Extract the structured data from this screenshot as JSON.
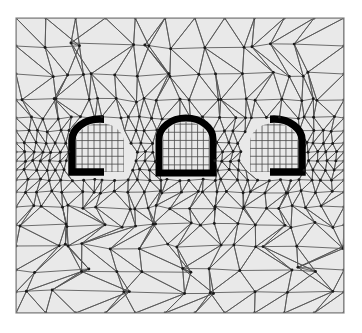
{
  "figure": {
    "kind": "finite-element-mesh",
    "title": "",
    "width": 362,
    "height": 333,
    "background_color": "#ffffff"
  },
  "colors": {
    "page_background": "#ffffff",
    "domain_fill": "#e9e9e9",
    "mesh_line": "#555555",
    "mesh_node": "#1a1a1a",
    "frame_border": "#8a8a8a",
    "quad_line": "#4a4a4a",
    "lining_black": "#000000"
  },
  "frame": {
    "x": 16,
    "y": 18,
    "width": 328,
    "height": 295,
    "border_width": 1.2
  },
  "mesh": {
    "type": "unstructured-triangular",
    "line_width": 0.85,
    "node_radius": 1.45,
    "refinement": "graded: coarse at top and bottom edges, fine near the three tunnel openings at mid-height",
    "row_y": [
      18,
      46,
      74,
      100,
      118,
      131,
      143,
      152,
      161,
      170,
      180,
      192,
      207,
      225,
      246,
      270,
      292,
      313
    ],
    "row_divisions": [
      11,
      13,
      16,
      20,
      26,
      30,
      34,
      38,
      38,
      34,
      30,
      26,
      22,
      18,
      15,
      13,
      11,
      11
    ],
    "row_jitter": [
      0.0,
      3.4,
      3.0,
      2.4,
      1.6,
      1.0,
      0.8,
      0.6,
      0.6,
      0.8,
      1.0,
      1.6,
      2.4,
      3.0,
      3.4,
      3.6,
      3.0,
      0.0
    ]
  },
  "openings": [
    {
      "id": "arch-left",
      "label": "left tunnel opening",
      "cx": 100,
      "half_width": 28,
      "top_y": 119,
      "spring_y": 140,
      "bottom_y": 172,
      "clip_left": 16,
      "clip_right": 344,
      "lining_side": "left",
      "lining_thickness": 7.5,
      "quad_cols": 8,
      "quad_rows": 7
    },
    {
      "id": "arch-middle",
      "label": "middle tunnel opening",
      "cx": 186,
      "half_width": 27,
      "top_y": 118,
      "spring_y": 139,
      "bottom_y": 173,
      "clip_left": 16,
      "clip_right": 344,
      "lining_side": "both",
      "lining_thickness": 7.0,
      "quad_cols": 8,
      "quad_rows": 7
    },
    {
      "id": "arch-right",
      "label": "right tunnel opening",
      "cx": 274,
      "half_width": 28,
      "top_y": 119,
      "spring_y": 140,
      "bottom_y": 172,
      "clip_left": 16,
      "clip_right": 344,
      "lining_side": "right",
      "lining_thickness": 7.5,
      "quad_cols": 8,
      "quad_rows": 7
    }
  ],
  "chart_data": {
    "type": "mesh",
    "title": "",
    "xlabel": "",
    "ylabel": "",
    "element_types": [
      "triangle",
      "quadrilateral"
    ],
    "opening_count": 3,
    "grid": false,
    "legend": "none"
  }
}
